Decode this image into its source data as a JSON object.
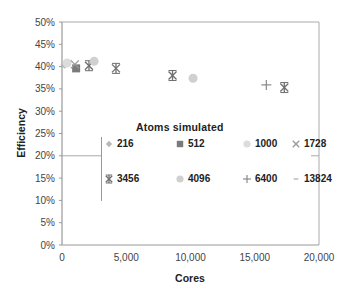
{
  "chart_data": {
    "type": "scatter",
    "title": "",
    "xlabel": "Cores",
    "ylabel": "Efficiency",
    "xlim": [
      0,
      20000
    ],
    "ylim": [
      0,
      50
    ],
    "x_ticks": [
      "0",
      "5,000",
      "10,000",
      "15,000",
      "20,000"
    ],
    "y_ticks": [
      "0%",
      "5%",
      "10%",
      "15%",
      "20%",
      "25%",
      "30%",
      "35%",
      "40%",
      "45%",
      "50%"
    ],
    "grid": false,
    "legend_title": "Atoms simulated",
    "legend_position": "center-inside",
    "series": [
      {
        "name": "216",
        "marker": "diamond",
        "color": "#b8b8b8",
        "points": [
          [
            200,
            40.4
          ]
        ]
      },
      {
        "name": "512",
        "marker": "square",
        "color": "#7a7a7a",
        "points": [
          [
            1100,
            39.6
          ]
        ]
      },
      {
        "name": "1000",
        "marker": "circle",
        "color": "#dcdcdc",
        "points": [
          [
            400,
            40.8
          ]
        ]
      },
      {
        "name": "1728",
        "marker": "x",
        "color": "#9a9a9a",
        "points": [
          [
            1000,
            40.5
          ]
        ]
      },
      {
        "name": "3456",
        "marker": "star",
        "color": "#6f6f6f",
        "points": [
          [
            2100,
            40.2
          ],
          [
            4200,
            39.6
          ],
          [
            8600,
            38.0
          ],
          [
            17300,
            35.3
          ]
        ]
      },
      {
        "name": "4096",
        "marker": "circle",
        "color": "#d0d0d0",
        "points": [
          [
            2500,
            41.2
          ],
          [
            10200,
            37.4
          ]
        ]
      },
      {
        "name": "6400",
        "marker": "plus",
        "color": "#8a8a8a",
        "points": [
          [
            15900,
            35.9
          ]
        ]
      },
      {
        "name": "13824",
        "marker": "dash",
        "color": "#aaaaaa",
        "points": []
      }
    ]
  }
}
